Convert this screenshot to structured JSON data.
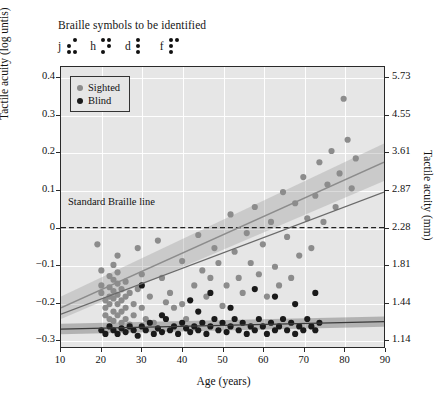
{
  "figure": {
    "title": "Braille symbols to be identified",
    "braille_symbols": [
      {
        "letter": "j",
        "dots": [
          0,
          1,
          1,
          1,
          0,
          1
        ]
      },
      {
        "letter": "h",
        "dots": [
          1,
          0,
          1,
          1,
          1,
          0
        ]
      },
      {
        "letter": "d",
        "dots": [
          1,
          1,
          1,
          0,
          0,
          0
        ]
      },
      {
        "letter": "f",
        "dots": [
          1,
          1,
          1,
          1,
          0,
          0
        ]
      }
    ]
  },
  "legend": {
    "position": "top-left",
    "items": [
      {
        "label": "Sighted",
        "color": "#8c8c8c"
      },
      {
        "label": "Blind",
        "color": "#1a1a1a"
      }
    ]
  },
  "annotation": {
    "standard_braille_line": "Standard Braille line",
    "line_value": 0
  },
  "chart_data": {
    "type": "scatter",
    "title": "Braille symbols to be identified",
    "xlabel": "Age (years)",
    "ylabel": "Tactile acuity (log untis)",
    "ylabel_right": "Tactile acuity (mm)",
    "xlim": [
      10,
      90
    ],
    "ylim": [
      -0.32,
      0.43
    ],
    "grid": true,
    "xticks": [
      10,
      20,
      30,
      40,
      50,
      60,
      70,
      80,
      90
    ],
    "yticks_left": [
      0.4,
      0.3,
      0.2,
      0.1,
      0,
      -0.1,
      -0.2,
      -0.3
    ],
    "yticks_right": [
      "5.73",
      "4.55",
      "3.61",
      "2.87",
      "2.28",
      "1.81",
      "1.44",
      "1.14"
    ],
    "yticks_right_values": [
      0.4,
      0.3,
      0.2,
      0.1,
      0,
      -0.1,
      -0.2,
      -0.3
    ],
    "series": [
      {
        "name": "Sighted",
        "color": "#8c8c8c",
        "marker": "circle",
        "points": [
          [
            19,
            -0.045
          ],
          [
            20,
            -0.115
          ],
          [
            20,
            -0.155
          ],
          [
            20,
            -0.175
          ],
          [
            21,
            -0.195
          ],
          [
            21,
            -0.215
          ],
          [
            21,
            -0.235
          ],
          [
            22,
            -0.13
          ],
          [
            22,
            -0.16
          ],
          [
            22,
            -0.185
          ],
          [
            22,
            -0.205
          ],
          [
            22,
            -0.245
          ],
          [
            23,
            -0.1
          ],
          [
            23,
            -0.14
          ],
          [
            23,
            -0.17
          ],
          [
            23,
            -0.19
          ],
          [
            23,
            -0.225
          ],
          [
            23,
            -0.25
          ],
          [
            24,
            -0.075
          ],
          [
            24,
            -0.12
          ],
          [
            24,
            -0.15
          ],
          [
            24,
            -0.18
          ],
          [
            24,
            -0.205
          ],
          [
            24,
            -0.235
          ],
          [
            25,
            -0.165
          ],
          [
            25,
            -0.195
          ],
          [
            25,
            -0.225
          ],
          [
            25,
            -0.255
          ],
          [
            26,
            -0.145
          ],
          [
            26,
            -0.185
          ],
          [
            26,
            -0.215
          ],
          [
            26,
            -0.245
          ],
          [
            27,
            -0.26
          ],
          [
            27,
            -0.175
          ],
          [
            28,
            -0.205
          ],
          [
            28,
            -0.235
          ],
          [
            29,
            -0.055
          ],
          [
            29,
            -0.165
          ],
          [
            30,
            -0.125
          ],
          [
            30,
            -0.215
          ],
          [
            31,
            -0.245
          ],
          [
            32,
            -0.185
          ],
          [
            33,
            -0.255
          ],
          [
            34,
            -0.035
          ],
          [
            35,
            -0.135
          ],
          [
            36,
            -0.2
          ],
          [
            37,
            -0.175
          ],
          [
            38,
            -0.215
          ],
          [
            40,
            -0.09
          ],
          [
            40,
            -0.205
          ],
          [
            41,
            -0.245
          ],
          [
            43,
            -0.155
          ],
          [
            44,
            -0.02
          ],
          [
            45,
            -0.115
          ],
          [
            46,
            -0.185
          ],
          [
            47,
            -0.135
          ],
          [
            48,
            -0.055
          ],
          [
            49,
            -0.095
          ],
          [
            50,
            -0.21
          ],
          [
            51,
            -0.155
          ],
          [
            52,
            0.035
          ],
          [
            53,
            -0.065
          ],
          [
            54,
            -0.135
          ],
          [
            55,
            -0.175
          ],
          [
            56,
            -0.015
          ],
          [
            57,
            -0.095
          ],
          [
            58,
            0.055
          ],
          [
            59,
            -0.125
          ],
          [
            60,
            -0.045
          ],
          [
            61,
            -0.185
          ],
          [
            62,
            0.015
          ],
          [
            63,
            -0.105
          ],
          [
            64,
            -0.155
          ],
          [
            65,
            0.095
          ],
          [
            66,
            -0.025
          ],
          [
            67,
            -0.135
          ],
          [
            68,
            0.065
          ],
          [
            69,
            -0.075
          ],
          [
            70,
            0.135
          ],
          [
            71,
            0.025
          ],
          [
            72,
            -0.055
          ],
          [
            73,
            0.085
          ],
          [
            74,
            0.175
          ],
          [
            75,
            0.015
          ],
          [
            76,
            0.115
          ],
          [
            77,
            0.205
          ],
          [
            78,
            0.055
          ],
          [
            79,
            0.145
          ],
          [
            80,
            0.345
          ],
          [
            81,
            0.235
          ],
          [
            82,
            0.105
          ],
          [
            83,
            0.185
          ]
        ]
      },
      {
        "name": "Blind",
        "color": "#1a1a1a",
        "marker": "circle",
        "points": [
          [
            20,
            -0.275
          ],
          [
            21,
            -0.285
          ],
          [
            22,
            -0.265
          ],
          [
            23,
            -0.275
          ],
          [
            24,
            -0.285
          ],
          [
            25,
            -0.27
          ],
          [
            26,
            -0.28
          ],
          [
            27,
            -0.265
          ],
          [
            28,
            -0.275
          ],
          [
            29,
            -0.29
          ],
          [
            30,
            -0.265
          ],
          [
            31,
            -0.275
          ],
          [
            32,
            -0.255
          ],
          [
            33,
            -0.285
          ],
          [
            34,
            -0.27
          ],
          [
            35,
            -0.28
          ],
          [
            36,
            -0.245
          ],
          [
            37,
            -0.275
          ],
          [
            38,
            -0.265
          ],
          [
            39,
            -0.285
          ],
          [
            40,
            -0.255
          ],
          [
            41,
            -0.27
          ],
          [
            42,
            -0.28
          ],
          [
            43,
            -0.265
          ],
          [
            44,
            -0.225
          ],
          [
            44,
            -0.275
          ],
          [
            45,
            -0.255
          ],
          [
            46,
            -0.285
          ],
          [
            47,
            -0.265
          ],
          [
            48,
            -0.245
          ],
          [
            49,
            -0.275
          ],
          [
            50,
            -0.255
          ],
          [
            51,
            -0.28
          ],
          [
            52,
            -0.265
          ],
          [
            53,
            -0.245
          ],
          [
            54,
            -0.275
          ],
          [
            55,
            -0.255
          ],
          [
            56,
            -0.285
          ],
          [
            57,
            -0.265
          ],
          [
            58,
            -0.275
          ],
          [
            59,
            -0.245
          ],
          [
            60,
            -0.265
          ],
          [
            61,
            -0.285
          ],
          [
            62,
            -0.255
          ],
          [
            63,
            -0.275
          ],
          [
            64,
            -0.265
          ],
          [
            65,
            -0.245
          ],
          [
            66,
            -0.275
          ],
          [
            67,
            -0.255
          ],
          [
            68,
            -0.285
          ],
          [
            69,
            -0.265
          ],
          [
            70,
            -0.275
          ],
          [
            71,
            -0.245
          ],
          [
            72,
            -0.265
          ],
          [
            73,
            -0.275
          ],
          [
            74,
            -0.255
          ],
          [
            30,
            -0.155
          ],
          [
            35,
            -0.235
          ],
          [
            42,
            -0.195
          ],
          [
            47,
            -0.175
          ],
          [
            52,
            -0.215
          ],
          [
            58,
            -0.165
          ],
          [
            63,
            -0.185
          ],
          [
            68,
            -0.205
          ],
          [
            73,
            -0.175
          ]
        ]
      }
    ],
    "regression_lines": [
      {
        "name": "Sighted fit",
        "color": "#8c8c8c",
        "x": [
          10,
          90
        ],
        "y": [
          -0.215,
          0.175
        ],
        "band_upper": [
          -0.185,
          0.225
        ],
        "band_lower": [
          -0.245,
          0.125
        ]
      },
      {
        "name": "Blind fit",
        "color": "#3a3a3a",
        "x": [
          10,
          90
        ],
        "y": [
          -0.272,
          -0.252
        ],
        "band_upper": [
          -0.258,
          -0.238
        ],
        "band_lower": [
          -0.286,
          -0.266
        ]
      },
      {
        "name": "Sighted fit darker",
        "color": "#6a6a6a",
        "x": [
          10,
          90
        ],
        "y": [
          -0.232,
          0.095
        ],
        "band_upper": null,
        "band_lower": null
      }
    ]
  }
}
